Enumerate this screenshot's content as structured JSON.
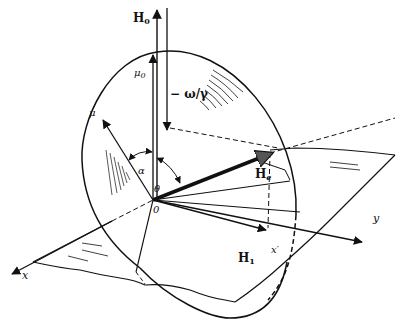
{
  "diagram": {
    "labels": {
      "H0": "H",
      "H0_sub": "0",
      "mu0": "μ",
      "mu0_sub": "0",
      "omega_gamma": "− ω/γ",
      "mu": "μ",
      "alpha": "α",
      "theta": "θ",
      "origin": "0",
      "He": "H",
      "He_sub": "e",
      "H1": "H",
      "H1_sub": "1",
      "x": "x",
      "x_prime": "x′",
      "y": "y"
    },
    "colors": {
      "ink": "#111111",
      "background": "#ffffff"
    }
  }
}
